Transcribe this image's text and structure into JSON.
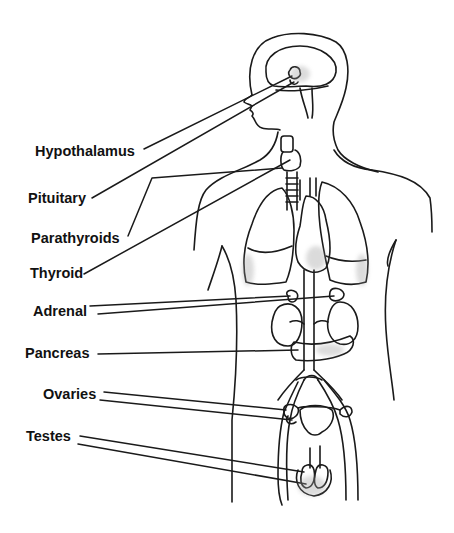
{
  "diagram": {
    "ink_color": "#1a1a1a",
    "shade_color": "#9a9a9a",
    "background": "#ffffff",
    "labels": [
      {
        "id": "hypothalamus",
        "text": "Hypothalamus",
        "x": 35,
        "y": 144
      },
      {
        "id": "pituitary",
        "text": "Pituitary",
        "x": 28,
        "y": 191
      },
      {
        "id": "parathyroids",
        "text": "Parathyroids",
        "x": 31,
        "y": 231
      },
      {
        "id": "thyroid",
        "text": "Thyroid",
        "x": 30,
        "y": 266
      },
      {
        "id": "adrenal",
        "text": "Adrenal",
        "x": 33,
        "y": 304
      },
      {
        "id": "pancreas",
        "text": "Pancreas",
        "x": 25,
        "y": 346
      },
      {
        "id": "ovaries",
        "text": "Ovaries",
        "x": 43,
        "y": 387
      },
      {
        "id": "testes",
        "text": "Testes",
        "x": 26,
        "y": 429
      }
    ]
  }
}
